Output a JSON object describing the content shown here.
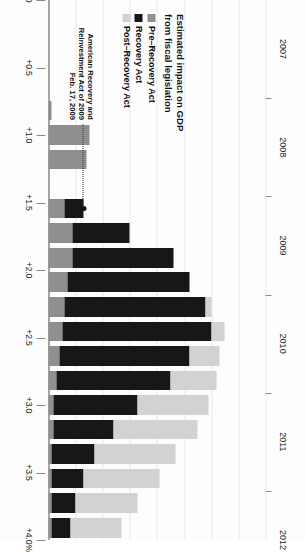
{
  "legend": {
    "title_line1": "Estimated impact on GDP",
    "title_line2": "from fiscal legislation",
    "items": [
      {
        "label": "Pre–Recovery Act",
        "color": "#8f8f8f",
        "key": "pre"
      },
      {
        "label": "Recovery Act",
        "color": "#171717",
        "key": "act"
      },
      {
        "label": "Post–Recovery Act",
        "color": "#d2d2d2",
        "key": "post"
      }
    ]
  },
  "annotation": {
    "line1": "American Recovery and",
    "line2": "Reinvestment Act of 2009",
    "line3": "Feb. 17, 2009"
  },
  "chart_data": {
    "type": "bar",
    "title": "Estimated impact on GDP from fiscal legislation",
    "xlabel": "",
    "ylabel": "Estimated impact on GDP from fiscal legislation",
    "ylim": [
      0,
      4.0
    ],
    "grid": true,
    "legend_position": "bottom-left",
    "stacked": true,
    "orientation": "horizontal-page-rotated",
    "ytick_labels": [
      "+4.0%",
      "+3.5",
      "+3.0",
      "+2.5",
      "+2.0",
      "+1.5",
      "+1.0",
      "+0.5",
      "0"
    ],
    "ytick_values": [
      4.0,
      3.5,
      3.0,
      2.5,
      2.0,
      1.5,
      1.0,
      0.5,
      0
    ],
    "xtick_labels": [
      "2007",
      "2008",
      "2009",
      "2010",
      "2011",
      "2012"
    ],
    "categories": [
      "2007 Q1",
      "2007 Q2",
      "2007 Q3",
      "2007 Q4",
      "2008 Q1",
      "2008 Q2",
      "2008 Q3",
      "2008 Q4",
      "2009 Q1",
      "2009 Q2",
      "2009 Q3",
      "2009 Q4",
      "2010 Q1",
      "2010 Q2",
      "2010 Q3",
      "2010 Q4",
      "2011 Q1",
      "2011 Q2",
      "2011 Q3",
      "2011 Q4",
      "2012 Q1",
      "2012 Q2"
    ],
    "series": [
      {
        "name": "Pre–Recovery Act",
        "color": "#8f8f8f",
        "values": [
          0,
          0,
          0,
          0,
          0.05,
          0.75,
          0.7,
          0,
          0.3,
          0.45,
          0.45,
          0.35,
          0.3,
          0.25,
          0.2,
          0.15,
          0.1,
          0.1,
          0.05,
          0.05,
          0.05,
          0.05
        ]
      },
      {
        "name": "Recovery Act",
        "color": "#171717",
        "values": [
          0,
          0,
          0,
          0,
          0,
          0,
          0,
          0,
          0.35,
          1.05,
          1.85,
          2.25,
          2.6,
          2.75,
          2.4,
          2.1,
          1.55,
          1.1,
          0.8,
          0.6,
          0.45,
          0.35
        ]
      },
      {
        "name": "Post–Recovery Act",
        "color": "#d2d2d2",
        "values": [
          0,
          0,
          0,
          0,
          0,
          0,
          0,
          0,
          0,
          0,
          0,
          0,
          0.1,
          0.25,
          0.55,
          0.85,
          1.3,
          1.55,
          1.5,
          1.4,
          1.15,
          0.95
        ]
      }
    ],
    "annotations": [
      {
        "text": "American Recovery and Reinvestment Act of 2009 — Feb. 17, 2009",
        "points_to": "2009 Q1"
      }
    ]
  }
}
